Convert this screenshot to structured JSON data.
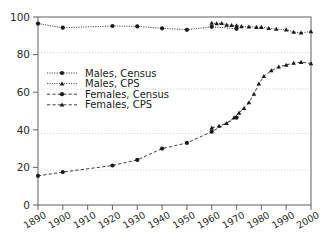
{
  "chart_data": {
    "type": "line",
    "title": "",
    "subtitle": "",
    "xlabel": "",
    "ylabel": "",
    "xlim": [
      1890,
      2000
    ],
    "ylim": [
      0,
      100
    ],
    "grid": true,
    "grid_axis": "y",
    "legend_position": "center-left",
    "x_ticks": [
      "1890",
      "1900",
      "1910",
      "1920",
      "1930",
      "1940",
      "1950",
      "1960",
      "1970",
      "1980",
      "1990",
      "2000"
    ],
    "y_ticks": [
      "0",
      "20",
      "40",
      "60",
      "80",
      "100"
    ],
    "series": [
      {
        "name": "Males, Census",
        "marker": "circle",
        "linestyle": "solid",
        "color": "#1a1a1a",
        "x": [
          1890,
          1900,
          1920,
          1930,
          1940,
          1950,
          1960,
          1970
        ],
        "values": [
          96.5,
          94.3,
          95.2,
          95.0,
          94.0,
          93.2,
          94.8,
          93.7
        ]
      },
      {
        "name": "Males, CPS",
        "marker": "triangle",
        "linestyle": "solid",
        "color": "#1a1a1a",
        "x": [
          1960,
          1962,
          1964,
          1966,
          1968,
          1970,
          1972,
          1975,
          1978,
          1980,
          1983,
          1986,
          1990,
          1993,
          1996,
          2000
        ],
        "values": [
          96.8,
          96.5,
          96.7,
          95.8,
          95.6,
          95.4,
          95.0,
          94.8,
          94.6,
          94.6,
          94.0,
          93.6,
          93.3,
          92.0,
          91.6,
          92.3
        ]
      },
      {
        "name": "Females, Census",
        "marker": "circle",
        "linestyle": "dashed",
        "color": "#1a1a1a",
        "x": [
          1890,
          1900,
          1920,
          1930,
          1940,
          1950,
          1960,
          1970
        ],
        "values": [
          15.5,
          17.5,
          21.0,
          24.0,
          30.0,
          33.0,
          39.0,
          46.5
        ]
      },
      {
        "name": "Females, CPS",
        "marker": "triangle",
        "linestyle": "dashed",
        "color": "#1a1a1a",
        "x": [
          1960,
          1963,
          1966,
          1969,
          1971,
          1973,
          1975,
          1977,
          1979,
          1981,
          1984,
          1987,
          1990,
          1993,
          1996,
          2000
        ],
        "values": [
          41.0,
          42.0,
          43.5,
          46.5,
          49.0,
          51.5,
          54.5,
          59.0,
          64.5,
          68.5,
          71.5,
          73.5,
          74.5,
          75.5,
          76.0,
          75.3
        ]
      }
    ]
  }
}
